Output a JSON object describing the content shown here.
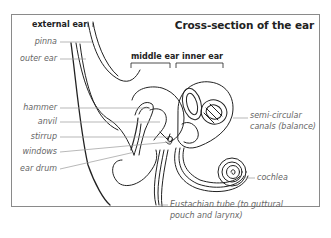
{
  "diagram": {
    "title": "Cross-section of the ear",
    "sections": {
      "external_ear": "external ear",
      "middle_ear": "middle ear",
      "inner_ear": "inner ear"
    },
    "left_labels": {
      "pinna": "pinna",
      "outer_ear": "outer ear",
      "hammer": "hammer",
      "anvil": "anvil",
      "stirrup": "stirrup",
      "windows": "windows",
      "ear_drum": "ear drum"
    },
    "right_labels": {
      "semicircular_line1": "semi-circular",
      "semicircular_line2": "canals (balance)",
      "cochlea": "cochlea",
      "eustachian_line1": "Eustachian tube (to guttural",
      "eustachian_line2": "pouch and larynx)"
    },
    "colors": {
      "outline": "#222222",
      "leader_line": "#999999",
      "label_text": "#666666",
      "frame": "#8a8a8a"
    }
  }
}
